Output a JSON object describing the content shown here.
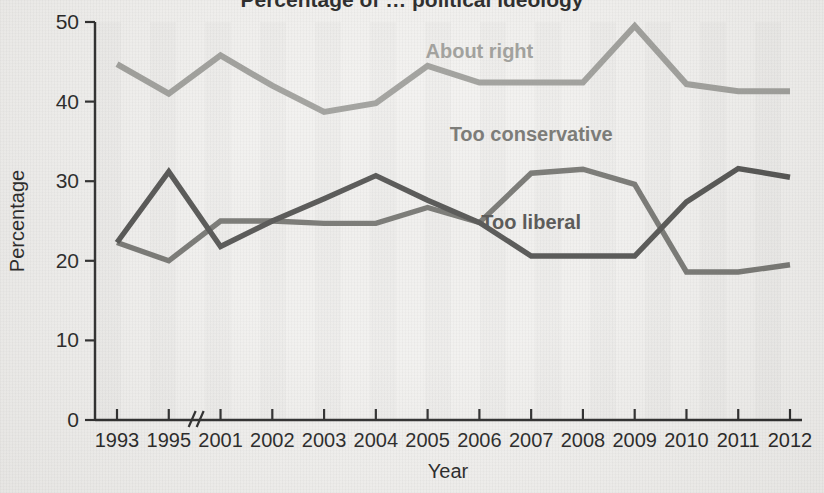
{
  "figure": {
    "title_partial": "Percentage of … political ideology",
    "background_note": "scanned-page"
  },
  "chart_data": {
    "type": "line",
    "title": "",
    "xlabel": "Year",
    "ylabel": "Percentage",
    "ylim": [
      0,
      50
    ],
    "yticks": [
      0,
      10,
      20,
      30,
      40,
      50
    ],
    "ytick_labels": [
      "0",
      "10",
      "20",
      "30",
      "40",
      "50"
    ],
    "categories": [
      "1993",
      "1995",
      "2001",
      "2002",
      "2003",
      "2004",
      "2005",
      "2006",
      "2007",
      "2008",
      "2009",
      "2010",
      "2011",
      "2012"
    ],
    "axis_break": {
      "after": "1995",
      "symbol": "//"
    },
    "grid": false,
    "legend": "inline-labels",
    "series": [
      {
        "name": "About right",
        "color": "#9a9a96",
        "values": [
          44.7,
          41.0,
          45.8,
          42.0,
          38.7,
          39.8,
          44.5,
          42.4,
          42.4,
          42.4,
          49.5,
          42.2,
          41.3,
          41.3
        ],
        "label_x": "2006",
        "label_y": 45.5
      },
      {
        "name": "Too conservative",
        "color": "#6e6e6a",
        "values": [
          22.3,
          20.0,
          25.0,
          25.0,
          24.7,
          24.7,
          26.7,
          24.8,
          31.0,
          31.5,
          29.6,
          18.6,
          18.6,
          19.5
        ],
        "label_x": "2007",
        "label_y": 35.0
      },
      {
        "name": "Too liberal",
        "color": "#4a4a48",
        "values": [
          22.3,
          31.2,
          21.8,
          25.0,
          27.8,
          30.7,
          27.6,
          24.8,
          20.6,
          20.6,
          20.6,
          27.4,
          31.6,
          30.5
        ],
        "label_x": "2007",
        "label_y": 24.0
      }
    ]
  },
  "labels": {
    "about_right": "About right",
    "too_conservative": "Too conservative",
    "too_liberal": "Too liberal",
    "x_axis_title": "Year",
    "y_axis_title": "Percentage"
  },
  "ticks": {
    "y": [
      "0",
      "10",
      "20",
      "30",
      "40",
      "50"
    ],
    "x": [
      "1993",
      "1995",
      "2001",
      "2002",
      "2003",
      "2004",
      "2005",
      "2006",
      "2007",
      "2008",
      "2009",
      "2010",
      "2011",
      "2012"
    ],
    "break_symbol": "//"
  }
}
